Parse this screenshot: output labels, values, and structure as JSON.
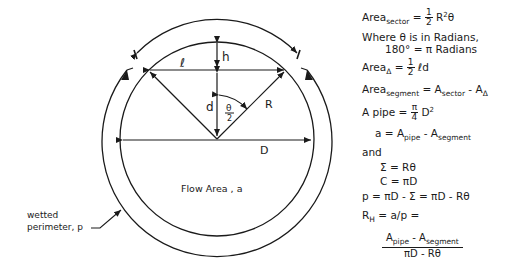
{
  "diagram": {
    "labels": {
      "h": "h",
      "l": "ℓ",
      "d": "d",
      "R": "R",
      "D": "D",
      "theta_half_num": "θ",
      "theta_half_den": "2",
      "flow_area": "Flow Area , a",
      "wetted_line1": "wetted",
      "wetted_line2": "perimeter, p"
    },
    "colors": {
      "ink": "#1a1a1a",
      "background": "#ffffff"
    }
  },
  "equations": {
    "area_sector": {
      "lhs": "Area",
      "lhs_sub": "sector",
      "eq": " = ",
      "frac_num": "1",
      "frac_den": "2",
      "rhs": " R",
      "rhs_sup": "2",
      "rhs_tail": "θ"
    },
    "theta_note_line1": "Where θ is in Radians,",
    "theta_note_line2": "180° = π Radians",
    "area_triangle": {
      "lhs": "Area",
      "lhs_sub": "Δ",
      "eq": " = ",
      "frac_num": "1",
      "frac_den": "2",
      "rhs": " ℓd"
    },
    "area_segment": {
      "lhs": "Area",
      "lhs_sub": "segment",
      "eq": " = A",
      "rhs_sub1": "sector",
      "mid": " - A",
      "rhs_sub2": "Δ"
    },
    "a_pipe": {
      "lhs": "A pipe",
      "eq": "  = ",
      "frac_num": "π",
      "frac_den": "4",
      "rhs": " D",
      "rhs_sup": "2"
    },
    "a_def": {
      "lhs": "a = A",
      "sub1": "pipe",
      "mid": " - A",
      "sub2": "segment"
    },
    "and": "and",
    "sigma": "Σ = Rθ",
    "circ": "C = πD",
    "p_def": "p = πD - Σ = πD - Rθ",
    "rh": {
      "lhs": "R",
      "lhs_sub": "H",
      "rhs": " = a/p ="
    },
    "rh_frac": {
      "num_a": "A",
      "num_sub1": "pipe",
      "num_mid": " - A",
      "num_sub2": "segment",
      "den": "πD - Rθ"
    }
  }
}
